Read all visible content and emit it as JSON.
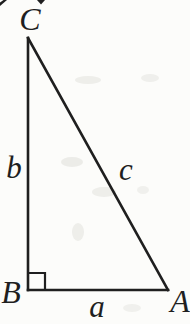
{
  "figure": {
    "kind": "right-triangle-diagram",
    "background_color": "#fcfcfa",
    "ink_color": "#1f1f1f",
    "smudge_color": "#dededa",
    "vertices": [
      {
        "label": "C",
        "position": "top"
      },
      {
        "label": "B",
        "position": "bottom-left"
      },
      {
        "label": "A",
        "position": "bottom-right"
      }
    ],
    "sides": [
      {
        "label": "b",
        "between": "B-C",
        "orientation": "vertical-left"
      },
      {
        "label": "c",
        "between": "C-A",
        "orientation": "hypotenuse"
      },
      {
        "label": "a",
        "between": "B-A",
        "orientation": "horizontal-bottom"
      }
    ],
    "right_angle_at": "B"
  }
}
